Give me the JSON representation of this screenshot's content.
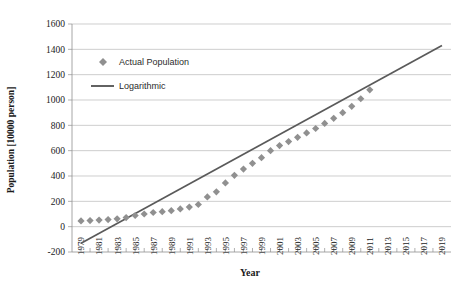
{
  "chart_data": {
    "type": "scatter",
    "title": "",
    "xlabel": "Year",
    "ylabel": "Population [10000 person]",
    "xlim": [
      1978,
      2020
    ],
    "ylim": [
      -200,
      1600
    ],
    "ytick_step": 200,
    "grid": true,
    "legend_position": "upper-left-inside",
    "yticks": [
      1600,
      1400,
      1200,
      1000,
      800,
      600,
      400,
      200,
      0,
      -200
    ],
    "xticks": [
      1979,
      1981,
      1983,
      1985,
      1987,
      1989,
      1991,
      1993,
      1995,
      1997,
      1999,
      2001,
      2003,
      2005,
      2007,
      2009,
      2011,
      2013,
      2015,
      2017,
      2019
    ],
    "series": [
      {
        "name": "Actual Population",
        "marker": "diamond",
        "color": "#909090",
        "x": [
          1979,
          1980,
          1981,
          1982,
          1983,
          1984,
          1985,
          1986,
          1987,
          1988,
          1989,
          1990,
          1991,
          1992,
          1993,
          1994,
          1995,
          1996,
          1997,
          1998,
          1999,
          2000,
          2001,
          2002,
          2003,
          2004,
          2005,
          2006,
          2007,
          2008,
          2009,
          2010,
          2011
        ],
        "values": [
          45,
          48,
          52,
          56,
          62,
          72,
          88,
          100,
          112,
          118,
          126,
          140,
          155,
          175,
          235,
          275,
          345,
          405,
          455,
          500,
          545,
          600,
          640,
          672,
          705,
          740,
          775,
          815,
          855,
          900,
          950,
          1010,
          1080
        ]
      },
      {
        "name": "Logarithmic",
        "marker": "line",
        "color": "#5a5a5a",
        "x": [
          1979,
          2019
        ],
        "values": [
          -130,
          1430
        ]
      }
    ]
  },
  "legend": {
    "items": [
      {
        "label": "Actual Population",
        "symbol": "diamond"
      },
      {
        "label": "Logarithmic",
        "symbol": "line"
      }
    ]
  },
  "axis": {
    "x_title": "Year",
    "y_title": "Population [10000 person]"
  }
}
